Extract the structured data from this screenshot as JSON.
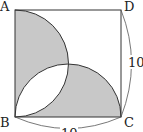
{
  "figure": {
    "vertices": {
      "A": "A",
      "B": "B",
      "C": "C",
      "D": "D"
    },
    "dimensions": {
      "DC": "10",
      "BC": "10"
    },
    "colors": {
      "shade": "#c8c8c8",
      "stroke": "#333333"
    }
  }
}
